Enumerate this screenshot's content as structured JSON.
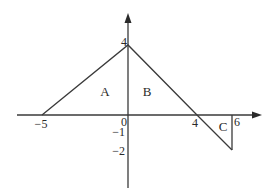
{
  "diagram": {
    "type": "piecewise-linear-graph",
    "axes": {
      "x_ticks": [
        {
          "value": -5,
          "label": "−5"
        },
        {
          "value": 0,
          "label": "0"
        },
        {
          "value": 4,
          "label": "4"
        },
        {
          "value": 6,
          "label": "6"
        }
      ],
      "y_ticks": [
        {
          "value": 4,
          "label": "4"
        },
        {
          "value": -1,
          "label": "−1"
        },
        {
          "value": -2,
          "label": "−2"
        }
      ]
    },
    "graph_points": [
      [
        -5,
        0
      ],
      [
        0,
        4
      ],
      [
        4,
        0
      ],
      [
        6,
        -2
      ]
    ],
    "vertical_segment": {
      "x": 6,
      "from": 0,
      "to": -2
    },
    "regions": [
      {
        "label": "A",
        "description": "triangle from x=-5 to x=0 above x-axis"
      },
      {
        "label": "B",
        "description": "triangle from x=0 to x=4 above x-axis"
      },
      {
        "label": "C",
        "description": "triangle from x=4 to x=6 below x-axis"
      }
    ],
    "line_color": "#3a3a3a"
  }
}
